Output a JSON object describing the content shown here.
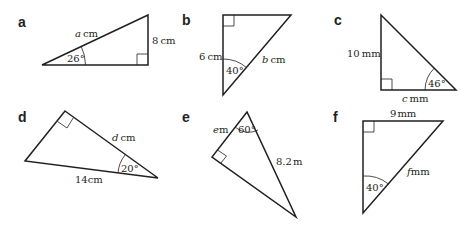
{
  "figure": {
    "background": "#ffffff",
    "line_color": "#231f20",
    "triangles": [
      {
        "id": "a",
        "label": "a",
        "hypotenuse": {
          "var": "a",
          "unit": "cm"
        },
        "side": "8 cm",
        "side_value": "8",
        "side_unit": "cm",
        "angle": "26°",
        "right_angle": true
      },
      {
        "id": "b",
        "label": "b",
        "hypotenuse": {
          "var": "b",
          "unit": "cm"
        },
        "side": "6 cm",
        "side_value": "6",
        "side_unit": "cm",
        "angle": "40°",
        "right_angle": true
      },
      {
        "id": "c",
        "label": "c",
        "unknown": {
          "var": "c",
          "unit": "mm"
        },
        "side": "10 mm",
        "side_value": "10",
        "side_unit": "mm",
        "angle": "46°",
        "right_angle": true
      },
      {
        "id": "d",
        "label": "d",
        "unknown": {
          "var": "d",
          "unit": "cm"
        },
        "side": "14 cm",
        "side_value": "14",
        "side_unit": "cm",
        "angle": "20°",
        "right_angle": true
      },
      {
        "id": "e",
        "label": "e",
        "unknown": {
          "var": "e",
          "unit": "m"
        },
        "side": "8.2 m",
        "side_value": "8.2",
        "side_unit": "m",
        "angle": "60°",
        "right_angle": true
      },
      {
        "id": "f",
        "label": "f",
        "unknown": {
          "var": "f",
          "unit": "mm"
        },
        "side": "9 mm",
        "side_value": "9",
        "side_unit": "mm",
        "angle": "40°",
        "right_angle": true
      }
    ]
  }
}
